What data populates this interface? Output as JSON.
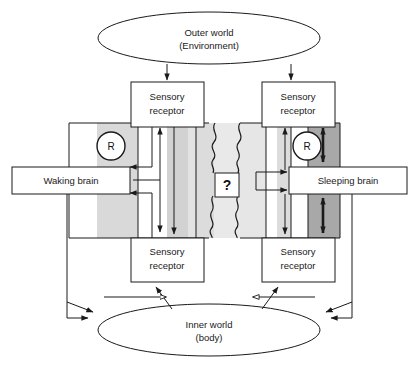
{
  "figure": {
    "title_nodes": {
      "outer_world": {
        "line1": "Outer world",
        "line2": "(Environment)"
      },
      "inner_world": {
        "line1": "Inner world",
        "line2": "(body)"
      }
    },
    "boxes": {
      "sensory_receptor_top_left": {
        "line1": "Sensory",
        "line2": "receptor"
      },
      "sensory_receptor_top_right": {
        "line1": "Sensory",
        "line2": "receptor"
      },
      "sensory_receptor_bottom_left": {
        "line1": "Sensory",
        "line2": "receptor"
      },
      "sensory_receptor_bottom_right": {
        "line1": "Sensory",
        "line2": "receptor"
      },
      "waking_brain": {
        "label": "Waking brain"
      },
      "sleeping_brain": {
        "label": "Sleeping brain"
      },
      "unknown_gate": {
        "label": "?"
      }
    },
    "markers": {
      "reticular_left": {
        "label": "R"
      },
      "reticular_right": {
        "label": "R"
      }
    },
    "colors": {
      "stroke": "#1a1a1a",
      "white": "#ffffff",
      "band_light": "#ebebeb",
      "band_mid": "#d6d6d6",
      "band_dark": "#a8a8a8",
      "text": "#1a1a1a"
    },
    "panels": {
      "left": {
        "name": "waking-panel"
      },
      "right": {
        "name": "sleeping-panel"
      }
    }
  }
}
